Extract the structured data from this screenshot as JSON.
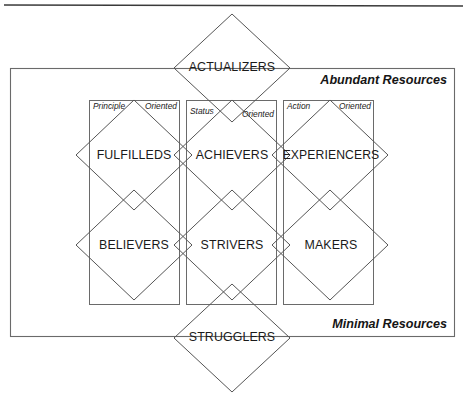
{
  "diagram": {
    "type": "vals-framework",
    "title_visible": false,
    "background_color": "#ffffff",
    "line_color": "#5a5a5a",
    "text_color": "#1a1a1a",
    "top_rule": {
      "name": "page-rule",
      "y": 5
    },
    "frame": {
      "name": "resources-frame",
      "x": 10,
      "y": 68,
      "width": 445,
      "height": 269
    },
    "resource_labels": {
      "top": "Abundant Resources",
      "bottom": "Minimal Resources"
    },
    "apex": {
      "label": "ACTUALIZERS",
      "cx": 232,
      "cy": 68,
      "rx": 58,
      "ry": 54
    },
    "base": {
      "label": "STRUGGLERS",
      "cx": 232,
      "cy": 338,
      "rx": 58,
      "ry": 54
    },
    "columns": [
      {
        "id": "principle",
        "orientation_left": "Principle",
        "orientation_right": "Oriented",
        "rect": {
          "x": 89,
          "y": 100,
          "width": 91,
          "height": 205
        },
        "upper": "FULFILLEDS",
        "lower": "BELIEVERS"
      },
      {
        "id": "status",
        "orientation_left": "Status",
        "orientation_right": "Oriented",
        "rect": {
          "x": 186,
          "y": 100,
          "width": 91,
          "height": 205
        },
        "upper": "ACHIEVERS",
        "lower": "STRIVERS"
      },
      {
        "id": "action",
        "orientation_left": "Action",
        "orientation_right": "Oriented",
        "rect": {
          "x": 283,
          "y": 100,
          "width": 91,
          "height": 205
        },
        "upper": "EXPERIENCERS",
        "lower": "MAKERS"
      }
    ],
    "segment_diamonds": {
      "rx": 58,
      "ry": 55,
      "row_upper_cy": 155,
      "row_lower_cy": 245,
      "centers_x": [
        134,
        232,
        330
      ]
    }
  }
}
